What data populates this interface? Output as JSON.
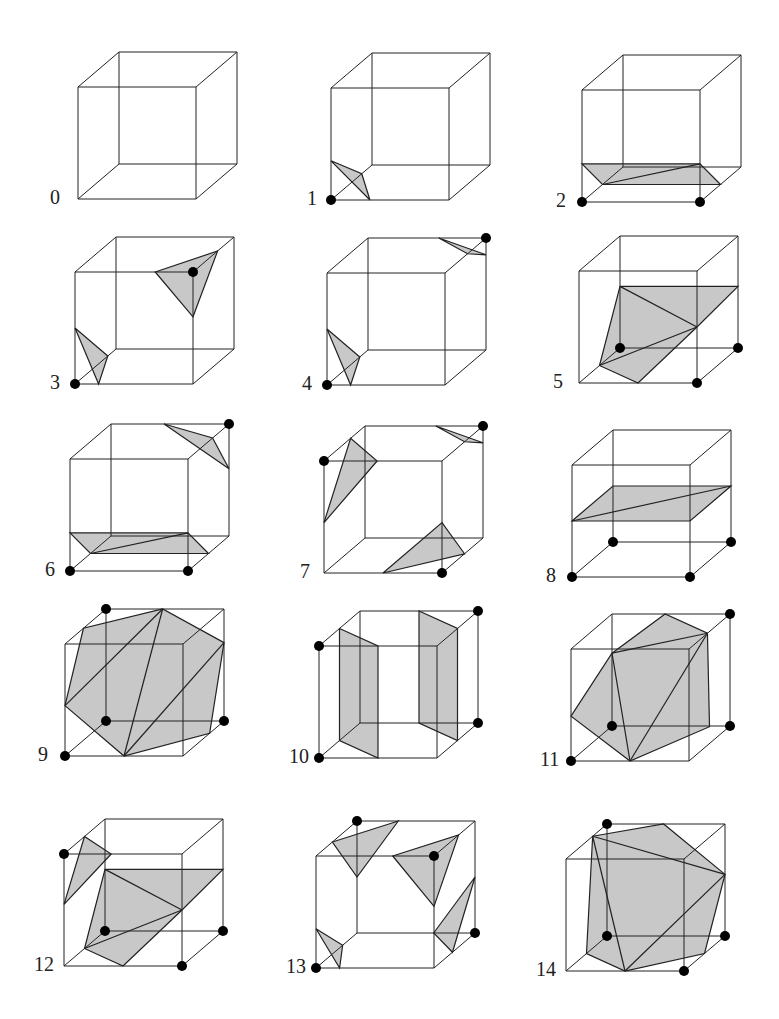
{
  "figure": {
    "fill_color": "#c8c8c8",
    "edge_color": "#222222",
    "dot_color": "#000000",
    "cube": {
      "w": 118,
      "h": 112,
      "dx": 41,
      "dy": -35
    },
    "cases": [
      {
        "label": "0",
        "origin": [
          78,
          199
        ],
        "label_pos": [
          50,
          198
        ],
        "dots": [],
        "polys": [],
        "lines": []
      },
      {
        "label": "1",
        "origin": [
          331,
          200
        ],
        "label_pos": [
          307,
          199
        ],
        "dots": [
          [
            0,
            0,
            0
          ]
        ],
        "polys": [
          [
            [
              0,
              0.35,
              0
            ],
            [
              0.33,
              0,
              0
            ],
            [
              0,
              0,
              0.75
            ]
          ]
        ],
        "lines": []
      },
      {
        "label": "2",
        "origin": [
          582,
          202
        ],
        "label_pos": [
          556,
          201
        ],
        "dots": [
          [
            0,
            0,
            0
          ],
          [
            1,
            0,
            0
          ]
        ],
        "polys": [
          [
            [
              0,
              0.34,
              0
            ],
            [
              1,
              0.34,
              0
            ],
            [
              1,
              0,
              0.5
            ],
            [
              0,
              0,
              0.5
            ]
          ]
        ],
        "lines": [
          [
            [
              0,
              0,
              0.5
            ],
            [
              1,
              0.34,
              0
            ]
          ]
        ]
      },
      {
        "label": "3",
        "origin": [
          75,
          384
        ],
        "label_pos": [
          50,
          383
        ],
        "dots": [
          [
            0,
            0,
            0
          ],
          [
            1,
            1,
            0
          ]
        ],
        "polys": [
          [
            [
              0,
              0.5,
              0
            ],
            [
              0.2,
              0,
              0
            ],
            [
              0,
              0,
              0.8
            ]
          ],
          [
            [
              0.68,
              1,
              0
            ],
            [
              1,
              0.6,
              0
            ],
            [
              1,
              1,
              0.6
            ]
          ]
        ],
        "lines": []
      },
      {
        "label": "4",
        "origin": [
          327,
          385
        ],
        "label_pos": [
          302,
          384
        ],
        "dots": [
          [
            0,
            0,
            0
          ],
          [
            1,
            1,
            1
          ]
        ],
        "polys": [
          [
            [
              0,
              0.5,
              0
            ],
            [
              0.2,
              0,
              0
            ],
            [
              0,
              0,
              0.8
            ]
          ],
          [
            [
              0.6,
              1,
              1
            ],
            [
              1,
              0.85,
              1
            ],
            [
              1,
              1,
              0.55
            ]
          ]
        ],
        "lines": []
      },
      {
        "label": "5",
        "origin": [
          579,
          383
        ],
        "label_pos": [
          553,
          382
        ],
        "dots": [
          [
            0,
            0,
            1
          ],
          [
            1,
            0,
            1
          ],
          [
            1,
            0,
            0
          ]
        ],
        "polys": [
          [
            [
              0,
              0.55,
              1
            ],
            [
              1,
              0.55,
              1
            ],
            [
              1,
              0.5,
              0
            ],
            [
              0.5,
              0,
              0
            ],
            [
              0,
              0,
              0.5
            ]
          ]
        ],
        "lines": [
          [
            [
              0,
              0.55,
              1
            ],
            [
              1,
              0.5,
              0
            ]
          ],
          [
            [
              0,
              0,
              0.5
            ],
            [
              1,
              0.5,
              0
            ]
          ]
        ]
      },
      {
        "label": "6",
        "origin": [
          70,
          571
        ],
        "label_pos": [
          45,
          570
        ],
        "dots": [
          [
            0,
            0,
            0
          ],
          [
            1,
            0,
            0
          ],
          [
            1,
            1,
            1
          ]
        ],
        "polys": [
          [
            [
              0,
              0.34,
              0
            ],
            [
              1,
              0.34,
              0
            ],
            [
              1,
              0,
              0.5
            ],
            [
              0,
              0,
              0.5
            ]
          ],
          [
            [
              0.45,
              1,
              1
            ],
            [
              1,
              0.6,
              1
            ],
            [
              1,
              1,
              0.6
            ]
          ]
        ],
        "lines": [
          [
            [
              0,
              0,
              0.5
            ],
            [
              1,
              0.34,
              0
            ]
          ]
        ]
      },
      {
        "label": "7",
        "origin": [
          324,
          573
        ],
        "label_pos": [
          300,
          572
        ],
        "dots": [
          [
            0,
            1,
            0
          ],
          [
            1,
            0,
            0
          ],
          [
            1,
            1,
            1
          ]
        ],
        "polys": [
          [
            [
              0.45,
              1,
              0
            ],
            [
              0,
              0.45,
              0
            ],
            [
              0,
              1,
              0.65
            ]
          ],
          [
            [
              0.5,
              0,
              0
            ],
            [
              1,
              0.45,
              0
            ],
            [
              1,
              0,
              0.55
            ]
          ],
          [
            [
              0.6,
              1,
              1
            ],
            [
              1,
              0.85,
              1
            ],
            [
              1,
              1,
              0.55
            ]
          ]
        ],
        "lines": []
      },
      {
        "label": "8",
        "origin": [
          572,
          577
        ],
        "label_pos": [
          546,
          576
        ],
        "dots": [
          [
            0,
            0,
            0
          ],
          [
            1,
            0,
            0
          ],
          [
            0,
            0,
            1
          ],
          [
            1,
            0,
            1
          ]
        ],
        "polys": [
          [
            [
              0,
              0.5,
              0
            ],
            [
              1,
              0.5,
              0
            ],
            [
              1,
              0.5,
              1
            ],
            [
              0,
              0.5,
              1
            ]
          ]
        ],
        "lines": [
          [
            [
              0,
              0.5,
              0
            ],
            [
              1,
              0.5,
              1
            ]
          ]
        ]
      },
      {
        "label": "9",
        "origin": [
          65,
          756
        ],
        "label_pos": [
          38,
          755
        ],
        "dots": [
          [
            0,
            0,
            0
          ],
          [
            0,
            0,
            1
          ],
          [
            1,
            0,
            1
          ],
          [
            0,
            1,
            1
          ]
        ],
        "polys": [
          [
            [
              0,
              0.45,
              0
            ],
            [
              0,
              1,
              0.45
            ],
            [
              0.48,
              1,
              1
            ],
            [
              1,
              0.7,
              1
            ],
            [
              1,
              0,
              0.65
            ],
            [
              0.5,
              0,
              0
            ]
          ]
        ],
        "lines": [
          [
            [
              0,
              0.45,
              0
            ],
            [
              0.48,
              1,
              1
            ]
          ],
          [
            [
              0.5,
              0,
              0
            ],
            [
              0.48,
              1,
              1
            ]
          ],
          [
            [
              0.5,
              0,
              0
            ],
            [
              1,
              0.7,
              1
            ]
          ]
        ]
      },
      {
        "label": "10",
        "origin": [
          319,
          758
        ],
        "label_pos": [
          289,
          757
        ],
        "dots": [
          [
            0,
            0,
            0
          ],
          [
            0,
            1,
            0
          ],
          [
            1,
            0,
            1
          ],
          [
            1,
            1,
            1
          ]
        ],
        "polys": [
          [
            [
              0,
              1,
              0.5
            ],
            [
              0.5,
              1,
              0
            ],
            [
              0.5,
              0,
              0
            ],
            [
              0,
              0,
              0.5
            ]
          ],
          [
            [
              0.5,
              1,
              1
            ],
            [
              1,
              1,
              0.5
            ],
            [
              1,
              0,
              0.5
            ],
            [
              0.5,
              0,
              1
            ]
          ]
        ],
        "lines": []
      },
      {
        "label": "11",
        "origin": [
          571,
          761
        ],
        "label_pos": [
          540,
          760
        ],
        "dots": [
          [
            0,
            0,
            0
          ],
          [
            0,
            0,
            1
          ],
          [
            1,
            0,
            1
          ],
          [
            1,
            1,
            1
          ]
        ],
        "polys": [
          [
            [
              0,
              0.4,
              0
            ],
            [
              0,
              0.65,
              1
            ],
            [
              0.45,
              1,
              1
            ],
            [
              1,
              1,
              0.45
            ],
            [
              1,
              0.15,
              0.5
            ],
            [
              0.5,
              0,
              0
            ]
          ]
        ],
        "lines": [
          [
            [
              0,
              0.65,
              1
            ],
            [
              1,
              1,
              0.45
            ]
          ],
          [
            [
              0,
              0.65,
              1
            ],
            [
              0.5,
              0,
              0
            ]
          ],
          [
            [
              0.5,
              0,
              0
            ],
            [
              1,
              1,
              0.45
            ]
          ]
        ]
      },
      {
        "label": "12",
        "origin": [
          64,
          966
        ],
        "label_pos": [
          34,
          965
        ],
        "dots": [
          [
            0,
            1,
            0
          ],
          [
            0,
            0,
            1
          ],
          [
            1,
            0,
            1
          ],
          [
            1,
            0,
            0
          ]
        ],
        "polys": [
          [
            [
              0,
              0.55,
              1
            ],
            [
              1,
              0.55,
              1
            ],
            [
              1,
              0.5,
              0
            ],
            [
              0.5,
              0,
              0
            ],
            [
              0,
              0,
              0.5
            ]
          ],
          [
            [
              0.4,
              1,
              0
            ],
            [
              0,
              0.55,
              0
            ],
            [
              0,
              1,
              0.5
            ]
          ]
        ],
        "lines": [
          [
            [
              0,
              0.55,
              1
            ],
            [
              1,
              0.5,
              0
            ]
          ],
          [
            [
              0,
              0,
              0.5
            ],
            [
              1,
              0.5,
              0
            ]
          ]
        ]
      },
      {
        "label": "13",
        "origin": [
          316,
          968
        ],
        "label_pos": [
          286,
          967
        ],
        "dots": [
          [
            0,
            0,
            0
          ],
          [
            0,
            1,
            1
          ],
          [
            1,
            1,
            0
          ],
          [
            1,
            0,
            1
          ]
        ],
        "polys": [
          [
            [
              0,
              0.35,
              0
            ],
            [
              0.2,
              0,
              0
            ],
            [
              0,
              0,
              0.65
            ]
          ],
          [
            [
              0.35,
              1,
              1
            ],
            [
              0,
              1,
              0.4
            ],
            [
              0,
              0.5,
              1
            ]
          ],
          [
            [
              0.65,
              1,
              0
            ],
            [
              1,
              0.55,
              0
            ],
            [
              1,
              1,
              0.6
            ]
          ],
          [
            [
              0.65,
              0,
              1
            ],
            [
              1,
              0.5,
              1
            ],
            [
              1,
              0,
              0.45
            ]
          ]
        ],
        "lines": []
      },
      {
        "label": "14",
        "origin": [
          566,
          971
        ],
        "label_pos": [
          536,
          970
        ],
        "dots": [
          [
            1,
            0,
            0
          ],
          [
            0,
            0,
            1
          ],
          [
            1,
            0,
            1
          ],
          [
            0,
            1,
            1
          ]
        ],
        "polys": [
          [
            [
              0,
              1,
              0.65
            ],
            [
              0.48,
              1,
              1
            ],
            [
              1,
              0.55,
              1
            ],
            [
              1,
              0,
              0.5
            ],
            [
              0.5,
              0,
              0
            ],
            [
              0,
              0,
              0.5
            ]
          ]
        ],
        "lines": [
          [
            [
              0,
              1,
              0.65
            ],
            [
              1,
              0.55,
              1
            ]
          ],
          [
            [
              0,
              1,
              0.65
            ],
            [
              0.5,
              0,
              0
            ]
          ],
          [
            [
              0.5,
              0,
              0
            ],
            [
              1,
              0.55,
              1
            ]
          ]
        ]
      }
    ]
  }
}
